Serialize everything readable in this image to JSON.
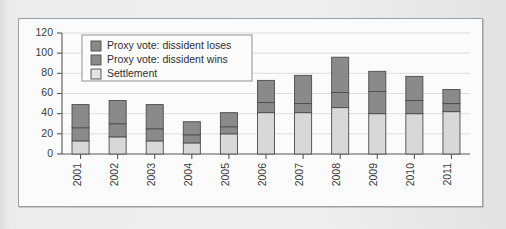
{
  "chart_data": {
    "type": "bar",
    "stacked": true,
    "title": "",
    "subtitle": "",
    "xlabel": "",
    "ylabel": "",
    "categories": [
      "2001",
      "2002",
      "2003",
      "2004",
      "2005",
      "2006",
      "2007",
      "2008",
      "2009",
      "2010",
      "2011"
    ],
    "series": [
      {
        "name": "Settlement",
        "color": "#d5d5d5",
        "values": [
          13,
          17,
          13,
          11,
          20,
          41,
          41,
          46,
          40,
          40,
          42
        ]
      },
      {
        "name": "Proxy vote: dissident wins",
        "color": "#8a8a8a",
        "values": [
          13,
          13,
          12,
          8,
          7,
          10,
          9,
          15,
          22,
          13,
          8
        ]
      },
      {
        "name": "Proxy vote: dissident loses",
        "color": "#8a8a8a",
        "values": [
          23,
          23,
          24,
          13,
          14,
          22,
          28,
          35,
          20,
          24,
          14
        ]
      }
    ],
    "totals": [
      49,
      53,
      49,
      32,
      41,
      73,
      78,
      96,
      82,
      77,
      64
    ],
    "ylim": [
      0,
      120
    ],
    "yticks": [
      0,
      20,
      40,
      60,
      80,
      100,
      120
    ],
    "ytick_labels": [
      "0",
      "20",
      "40",
      "60",
      "80",
      "100",
      "120"
    ],
    "grid": true,
    "legend_position": "top-left",
    "legend_entries": [
      {
        "label": "Proxy vote: dissident loses",
        "color": "#8a8a8a"
      },
      {
        "label": "Proxy vote: dissident wins",
        "color": "#8a8a8a"
      },
      {
        "label": "Settlement",
        "color": "#e2e2e2"
      }
    ]
  },
  "colors": {
    "panel_background": "#fbfbfb",
    "panel_border": "#9aa0a4",
    "page_background": "#e8e8e8",
    "axis": "#58585a",
    "grid": "#dedede",
    "segment_loses": "#8a8a8a",
    "segment_wins": "#8a8a8a",
    "segment_settlement": "#d8d8d8",
    "text": "#2e2e30"
  }
}
